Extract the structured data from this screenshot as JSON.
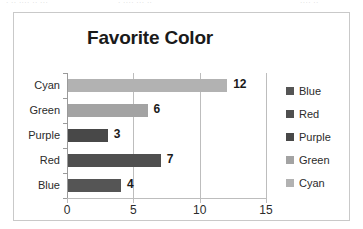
{
  "top_artifact": {
    "segment_a": "· ·· ···· ·· ···",
    "segment_b": "· ···· ··· ··",
    "segment_c": "···· ··"
  },
  "chart_data": {
    "type": "bar",
    "orientation": "horizontal",
    "title": "Favorite Color",
    "xlabel": "",
    "ylabel": "",
    "categories": [
      "Blue",
      "Red",
      "Purple",
      "Green",
      "Cyan"
    ],
    "values": [
      4,
      7,
      3,
      6,
      12
    ],
    "data_labels": [
      "4",
      "7",
      "3",
      "6",
      "12"
    ],
    "display_order_top_to_bottom": [
      "Cyan",
      "Green",
      "Purple",
      "Red",
      "Blue"
    ],
    "xlim": [
      0,
      15
    ],
    "xticks": [
      0,
      5,
      10,
      15
    ],
    "xtick_labels": [
      "0",
      "5",
      "10",
      "15"
    ],
    "grid": "vertical",
    "legend": {
      "position": "right",
      "entries": [
        {
          "label": "Blue",
          "color": "#555555"
        },
        {
          "label": "Red",
          "color": "#4f4f4f"
        },
        {
          "label": "Purple",
          "color": "#484848"
        },
        {
          "label": "Green",
          "color": "#a3a3a3"
        },
        {
          "label": "Cyan",
          "color": "#b2b2b2"
        }
      ]
    },
    "series_colors": {
      "Blue": "#555555",
      "Red": "#4f4f4f",
      "Purple": "#484848",
      "Green": "#a3a3a3",
      "Cyan": "#b2b2b2"
    },
    "bars_top_to_bottom": [
      {
        "category": "Cyan",
        "value": 12,
        "label": "12",
        "color": "#b2b2b2"
      },
      {
        "category": "Green",
        "value": 6,
        "label": "6",
        "color": "#a3a3a3"
      },
      {
        "category": "Purple",
        "value": 3,
        "label": "3",
        "color": "#484848"
      },
      {
        "category": "Red",
        "value": 7,
        "label": "7",
        "color": "#4f4f4f"
      },
      {
        "category": "Blue",
        "value": 4,
        "label": "4",
        "color": "#555555"
      }
    ]
  }
}
